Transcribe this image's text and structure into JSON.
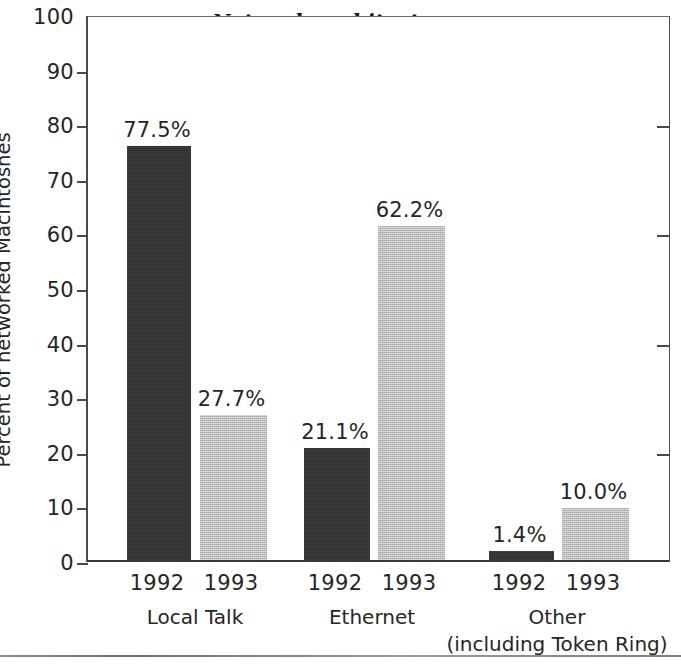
{
  "chart_data": {
    "type": "bar",
    "title": "Network architectures",
    "xlabel": "",
    "ylabel": "Percent of networked Macintoshes",
    "ylim": [
      0,
      100
    ],
    "ytick_labels": [
      "0",
      "10",
      "20",
      "30",
      "40",
      "50",
      "60",
      "70",
      "80",
      "90",
      "100"
    ],
    "ytick_values": [
      0,
      10,
      20,
      30,
      40,
      50,
      60,
      70,
      80,
      90,
      100
    ],
    "grid": false,
    "legend": "none",
    "categories": [
      "Local Talk",
      "Ethernet",
      "Other"
    ],
    "category_sublabels": [
      "",
      "",
      "(including Token Ring)"
    ],
    "series": [
      {
        "name": "1992",
        "color": "#2b2b2b",
        "values": [
          77.5,
          21.1,
          1.4
        ],
        "labels": [
          "77.5%",
          "21.1%",
          "1.4%"
        ]
      },
      {
        "name": "1993",
        "color": "#b9b9b9",
        "values": [
          27.7,
          62.2,
          10.0
        ],
        "labels": [
          "27.7%",
          "62.2%",
          "10.0%"
        ]
      }
    ],
    "bars": [
      {
        "group": "Local Talk",
        "year": "1992",
        "value": 77.5,
        "label": "77.5%",
        "style": "dark",
        "x": 125,
        "w": 64,
        "pix_top": 148
      },
      {
        "group": "Local Talk",
        "year": "1993",
        "value": 27.7,
        "label": "27.7%",
        "style": "light",
        "x": 198,
        "w": 67,
        "pix_top": 417
      },
      {
        "group": "Ethernet",
        "year": "1992",
        "value": 21.1,
        "label": "21.1%",
        "style": "dark",
        "x": 302,
        "w": 66,
        "pix_top": 450
      },
      {
        "group": "Ethernet",
        "year": "1993",
        "value": 62.2,
        "label": "62.2%",
        "style": "light",
        "x": 376,
        "w": 67,
        "pix_top": 228
      },
      {
        "group": "Other",
        "year": "1992",
        "value": 1.4,
        "label": "1.4%",
        "style": "dark",
        "x": 487,
        "w": 65,
        "pix_top": 553
      },
      {
        "group": "Other",
        "year": "1993",
        "value": 10.0,
        "label": "10.0%",
        "style": "light",
        "x": 560,
        "w": 67,
        "pix_top": 510
      }
    ],
    "group_label_x": [
      195,
      372,
      557
    ],
    "year_label_x": [
      157,
      231,
      335,
      409,
      519,
      593
    ]
  }
}
